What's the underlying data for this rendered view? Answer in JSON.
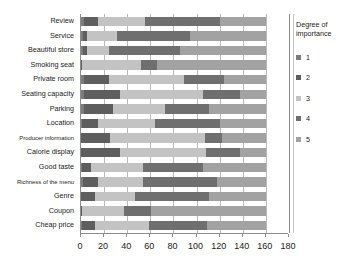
{
  "chart_data": {
    "type": "bar",
    "orientation": "horizontal",
    "stacked": true,
    "title": "",
    "xlabel": "",
    "ylabel": "",
    "xlim": [
      0,
      180
    ],
    "xticks": [
      0,
      20,
      40,
      60,
      80,
      100,
      120,
      140,
      160,
      180
    ],
    "grid": true,
    "legend_title": "Degree of importance",
    "legend_position": "right",
    "categories": [
      "Review",
      "Service",
      "Beautiful store",
      "Smoking seat",
      "Private room",
      "Seating capacity",
      "Parking",
      "Location",
      "Producer information",
      "Calorie display",
      "Good taste",
      "Richness of the menu",
      "Genre",
      "Coupon",
      "Cheap price"
    ],
    "series": [
      {
        "name": "1",
        "values": [
          3,
          2,
          2,
          0,
          3,
          3,
          3,
          1,
          0,
          0,
          1,
          2,
          0,
          0,
          1
        ]
      },
      {
        "name": "2",
        "values": [
          12,
          3,
          3,
          1,
          21,
          31,
          25,
          14,
          25,
          34,
          8,
          13,
          12,
          1,
          11
        ]
      },
      {
        "name": "3",
        "values": [
          40,
          26,
          19,
          51,
          65,
          72,
          45,
          49,
          82,
          74,
          45,
          39,
          35,
          36,
          47
        ]
      },
      {
        "name": "4",
        "values": [
          65,
          63,
          62,
          14,
          35,
          32,
          38,
          56,
          15,
          30,
          52,
          64,
          64,
          24,
          50
        ]
      },
      {
        "name": "5",
        "values": [
          40,
          66,
          74,
          94,
          36,
          22,
          49,
          40,
          38,
          22,
          54,
          42,
          49,
          99,
          51
        ]
      }
    ],
    "series_colors": [
      "#7c7c7c",
      "#5e5e5e",
      "#c3c3c3",
      "#6f6f6f",
      "#a2a2a2"
    ],
    "legend_entries": [
      {
        "label": "1",
        "color": "#7c7c7c"
      },
      {
        "label": "2",
        "color": "#5e5e5e"
      },
      {
        "label": "3",
        "color": "#c3c3c3"
      },
      {
        "label": "4",
        "color": "#6f6f6f"
      },
      {
        "label": "5",
        "color": "#a2a2a2"
      }
    ]
  }
}
